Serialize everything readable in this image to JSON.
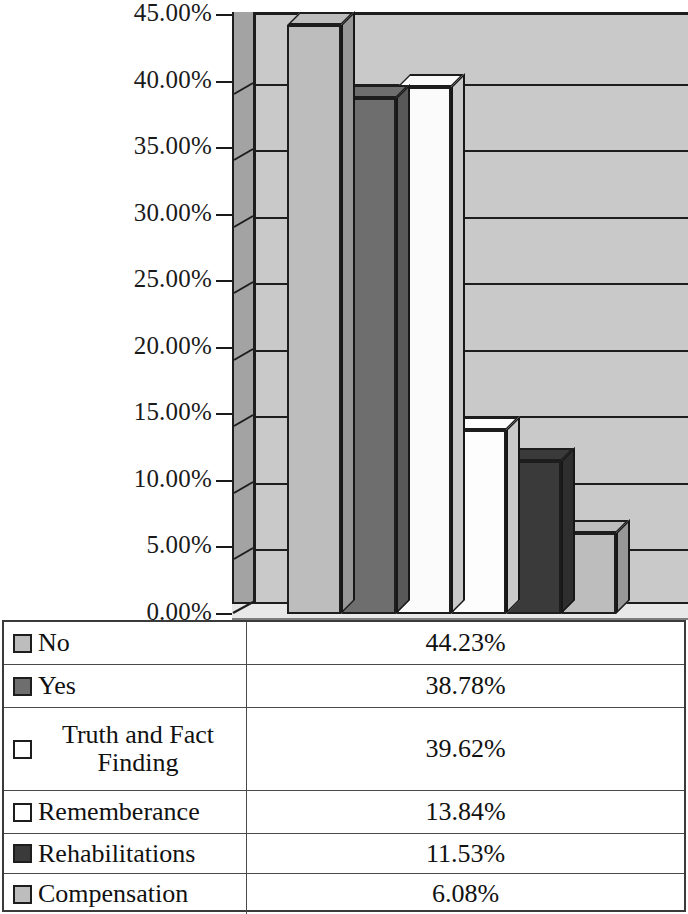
{
  "chart_data": {
    "type": "bar",
    "title": "",
    "xlabel": "",
    "ylabel": "",
    "ylim": [
      0,
      45
    ],
    "grid": true,
    "legend_position": "bottom-table",
    "three_d": true,
    "categories": [
      "No",
      "Yes",
      "Truth and Fact Finding",
      "Rememberance",
      "Rehabilitations",
      "Compensation"
    ],
    "values": [
      44.23,
      38.78,
      39.62,
      13.84,
      11.53,
      6.08
    ],
    "value_labels": [
      "44.23%",
      "38.78%",
      "39.62%",
      "13.84%",
      "11.53%",
      "6.08%"
    ],
    "ytick_labels": [
      "45.00%",
      "40.00%",
      "35.00%",
      "30.00%",
      "25.00%",
      "20.00%",
      "15.00%",
      "10.00%",
      "5.00%",
      "0.00%"
    ],
    "ytick_values": [
      45,
      40,
      35,
      30,
      25,
      20,
      15,
      10,
      5,
      0
    ],
    "series_colors": [
      "#bdbdbd",
      "#6e6e6e",
      "#fbfbfb",
      "#fdfdfd",
      "#3a3a3a",
      "#bdbdbd"
    ]
  },
  "legend_table": {
    "rows": [
      {
        "label": "No",
        "value": "44.23%",
        "swatch": "#bdbdbd",
        "swatch_name": "legend-swatch-no"
      },
      {
        "label": "Yes",
        "value": "38.78%",
        "swatch": "#6e6e6e",
        "swatch_name": "legend-swatch-yes"
      },
      {
        "label": "Truth and Fact Finding",
        "value": "39.62%",
        "swatch": "#ffffff",
        "swatch_name": "legend-swatch-truth-and-fact-finding"
      },
      {
        "label": "Rememberance",
        "value": "13.84%",
        "swatch": "#ffffff",
        "swatch_name": "legend-swatch-rememberance"
      },
      {
        "label": "Rehabilitations",
        "value": "11.53%",
        "swatch": "#3a3a3a",
        "swatch_name": "legend-swatch-rehabilitations"
      },
      {
        "label": "Compensation",
        "value": "6.08%",
        "swatch": "#bdbdbd",
        "swatch_name": "legend-swatch-compensation"
      }
    ]
  },
  "colors": {
    "back_wall": "#c9c9c9",
    "side_wall": "#a3a3a3",
    "floor": "#e8e8e8",
    "outline": "#1d1d1d",
    "text": "#111111"
  }
}
